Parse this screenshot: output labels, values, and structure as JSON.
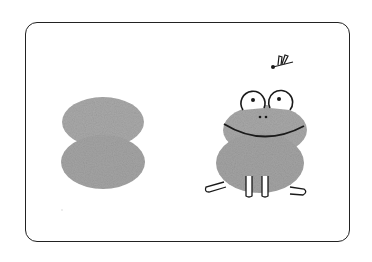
{
  "illustration": {
    "subject": "fingerprint frog illustration",
    "left_figure": "two stacked fingerprint blobs",
    "right_figure": "frog made from fingerprints looking up at a dragonfly",
    "colors": {
      "print": "#a8a8a8",
      "ink": "#1a1a1a",
      "frame": "#222222",
      "background": "#ffffff"
    }
  }
}
